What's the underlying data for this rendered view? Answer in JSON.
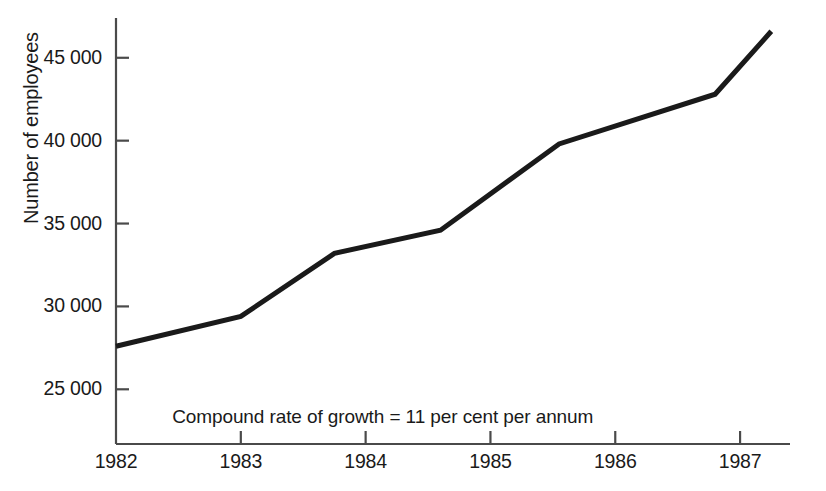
{
  "chart_data": {
    "type": "line",
    "title": "",
    "subtitle": "",
    "xlabel": "",
    "ylabel": "Number of employees",
    "x": [
      1982,
      1983,
      1983.75,
      1984.6,
      1985.55,
      1986.8,
      1987.25
    ],
    "values": [
      27600,
      29400,
      33200,
      34600,
      39800,
      42800,
      46600
    ],
    "series": [
      {
        "name": "Number of employees",
        "values": [
          27600,
          29400,
          33200,
          34600,
          39800,
          42800,
          46600
        ]
      }
    ],
    "xlim": [
      1982,
      1987.4
    ],
    "ylim": [
      21700,
      47400
    ],
    "xticks": [
      1982,
      1983,
      1984,
      1985,
      1986,
      1987
    ],
    "yticks": [
      25000,
      30000,
      35000,
      40000,
      45000
    ],
    "xtick_labels": [
      "1982",
      "1983",
      "1984",
      "1985",
      "1986",
      "1987"
    ],
    "ytick_labels": [
      "25 000",
      "30 000",
      "35 000",
      "40 000",
      "45 000"
    ],
    "grid": false,
    "legend": false,
    "legend_position": "none",
    "annotations": [
      {
        "text": "Compound rate of growth = 11 per cent per annum",
        "x": 1982.45,
        "y": 23300
      }
    ],
    "line_color": "#1a1a1a",
    "axis_color": "#4a4a4a",
    "background_color": "#ffffff",
    "line_width": 5
  },
  "axis": {
    "y_title": "Number of employees"
  },
  "annotation": {
    "growth_note": "Compound rate of growth = 11 per cent per annum"
  },
  "ticks": {
    "y": [
      {
        "label": "45 000",
        "value": 45000
      },
      {
        "label": "40 000",
        "value": 40000
      },
      {
        "label": "35 000",
        "value": 35000
      },
      {
        "label": "30 000",
        "value": 30000
      },
      {
        "label": "25 000",
        "value": 25000
      }
    ],
    "x": [
      {
        "label": "1982",
        "value": 1982
      },
      {
        "label": "1983",
        "value": 1983
      },
      {
        "label": "1984",
        "value": 1984
      },
      {
        "label": "1985",
        "value": 1985
      },
      {
        "label": "1986",
        "value": 1986
      },
      {
        "label": "1987",
        "value": 1987
      }
    ]
  }
}
